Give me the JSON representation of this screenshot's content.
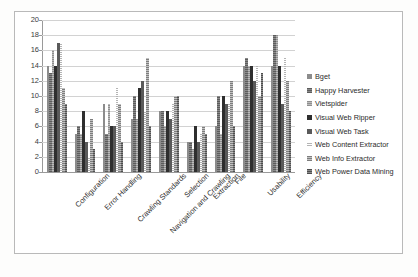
{
  "chart_data": {
    "type": "bar",
    "title": "",
    "xlabel": "",
    "ylabel": "",
    "ylim": [
      0,
      20
    ],
    "ytick_step": 2,
    "yticks": [
      0,
      2,
      4,
      6,
      8,
      10,
      12,
      14,
      16,
      18,
      20
    ],
    "grid": "horizontal",
    "legend_position": "right",
    "categories": [
      "Configuration",
      "Error Handling",
      "Crawling Standards",
      "Navigation and Crawling",
      "Selection",
      "Extraction",
      "File",
      "Usability",
      "Efficiency"
    ],
    "series": [
      {
        "name": "Bget",
        "color": "#8c8c8c",
        "values": [
          14,
          5,
          9,
          7,
          8,
          4,
          6,
          14,
          14
        ]
      },
      {
        "name": "Happy Harvester",
        "color": "#6f6f6f",
        "values": [
          13,
          6,
          5,
          10,
          8,
          4,
          10,
          15,
          18
        ]
      },
      {
        "name": "Vietspider",
        "color": "#a3a3a3",
        "values": [
          16,
          5,
          9,
          7,
          6,
          3,
          5,
          14,
          18
        ]
      },
      {
        "name": "Visual Web Ripper",
        "color": "#2e2e2e",
        "values": [
          14,
          8,
          6,
          11,
          8,
          6,
          10,
          14,
          14
        ]
      },
      {
        "name": "Visual Web Task",
        "color": "#5a5a5a",
        "values": [
          17,
          4,
          6,
          12,
          7,
          4,
          9,
          12,
          9
        ]
      },
      {
        "name": "Web Content Extractor",
        "color": "#d8d8d8",
        "values": [
          17,
          2,
          11,
          8,
          9,
          5,
          9,
          14,
          15
        ]
      },
      {
        "name": "Web Info Extractor",
        "color": "#9b9b9b",
        "values": [
          11,
          7,
          9,
          15,
          10,
          6,
          12,
          10,
          12
        ]
      },
      {
        "name": "Web Power Data Mining",
        "color": "#6a6a6a",
        "values": [
          9,
          3,
          4,
          6,
          10,
          5,
          6,
          13,
          8
        ]
      }
    ]
  }
}
